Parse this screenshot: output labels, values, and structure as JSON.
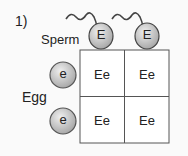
{
  "question_number": "1)",
  "sperm": {
    "label": "Sperm",
    "alleles": [
      "E",
      "E"
    ]
  },
  "egg": {
    "label": "Egg",
    "alleles": [
      "e",
      "e"
    ]
  },
  "punnett": {
    "cells": [
      [
        "Ee",
        "Ee"
      ],
      [
        "Ee",
        "Ee"
      ]
    ]
  },
  "colors": {
    "cell_fill": "#d3d3d3",
    "outline": "#444444",
    "grid_line": "#555555",
    "background": "#fafafa"
  }
}
